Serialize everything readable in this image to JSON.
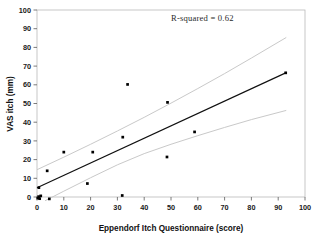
{
  "figure": {
    "width": 319,
    "height": 236,
    "background": "#ffffff",
    "frame_color": "#b9b9b9"
  },
  "annotation": {
    "r_squared_label": "R-squared  =  0.62"
  },
  "axes": {
    "x_title": "Eppendorf Itch Questionnaire (score)",
    "y_title": "VAS itch (mm)",
    "x_ticks": [
      "0",
      "10",
      "20",
      "30",
      "40",
      "50",
      "60",
      "70",
      "80",
      "90",
      "100"
    ],
    "y_ticks": [
      "0",
      "10",
      "20",
      "30",
      "40",
      "50",
      "60",
      "70",
      "80",
      "90",
      "100"
    ]
  },
  "chart_data": {
    "type": "scatter",
    "title": "",
    "xlabel": "Eppendorf Itch Questionnaire (score)",
    "ylabel": "VAS itch (mm)",
    "xlim": [
      0,
      100
    ],
    "ylim": [
      0,
      100
    ],
    "xticks": [
      0,
      10,
      20,
      30,
      40,
      50,
      60,
      70,
      80,
      90,
      100
    ],
    "yticks": [
      0,
      10,
      20,
      30,
      40,
      50,
      60,
      70,
      80,
      90,
      100
    ],
    "grid": false,
    "legend": null,
    "annotations": [
      {
        "text": "R-squared  =  0.62",
        "x": 56,
        "y": 94
      }
    ],
    "marker_color": "#000000",
    "marker_shape": "square",
    "points": [
      {
        "x": 0.3,
        "y": -0.6
      },
      {
        "x": 0.6,
        "y": 0.2
      },
      {
        "x": 1.0,
        "y": -0.9
      },
      {
        "x": 1.4,
        "y": 0.6
      },
      {
        "x": 0.7,
        "y": 5.0
      },
      {
        "x": 4.6,
        "y": -1.0
      },
      {
        "x": 3.8,
        "y": 14.0
      },
      {
        "x": 10.0,
        "y": 24.0
      },
      {
        "x": 18.8,
        "y": 7.2
      },
      {
        "x": 20.8,
        "y": 24.0
      },
      {
        "x": 31.8,
        "y": 0.8
      },
      {
        "x": 32.0,
        "y": 32.0
      },
      {
        "x": 33.8,
        "y": 60.2
      },
      {
        "x": 48.5,
        "y": 21.4
      },
      {
        "x": 48.7,
        "y": 50.6
      },
      {
        "x": 58.8,
        "y": 34.8
      },
      {
        "x": 92.8,
        "y": 66.4
      }
    ],
    "fit_line": {
      "name": "linear regression",
      "color": "#101010",
      "x": [
        0,
        93
      ],
      "y": [
        5.0,
        66.5
      ],
      "r_squared": 0.62
    },
    "confidence_bands": [
      {
        "name": "upper confidence limit",
        "color": "#c9c9c9",
        "x": [
          0,
          10,
          20,
          30,
          40,
          50,
          60,
          70,
          80,
          93
        ],
        "y": [
          14.6,
          21.3,
          28.2,
          35.3,
          42.6,
          50.2,
          58.0,
          66.0,
          74.3,
          85.3
        ]
      },
      {
        "name": "lower confidence limit",
        "color": "#c9c9c9",
        "x": [
          3,
          10,
          20,
          30,
          40,
          50,
          60,
          70,
          80,
          93
        ],
        "y": [
          -2.0,
          3.1,
          10.3,
          17.2,
          23.2,
          28.2,
          32.8,
          37.2,
          41.4,
          46.3
        ]
      }
    ]
  }
}
